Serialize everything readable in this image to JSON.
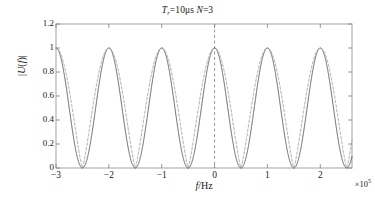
{
  "chart_data": {
    "type": "line",
    "title_parts": {
      "sym1": "T",
      "sub1": "r",
      "eq1": "=10μs ",
      "sym2": "N",
      "eq2": "=3"
    },
    "xlabel": "f/Hz",
    "xlabel_parts": {
      "italic": "f",
      "rest": "/Hz"
    },
    "ylabel": "|U(f)|",
    "ylabel_parts": {
      "pre": "|",
      "sym": "U",
      "open": "(",
      "var": "f",
      "close": ")",
      "post": "|"
    },
    "x_exponent_prefix": "×10",
    "x_exponent": "5",
    "xlim": [
      -3,
      2.6
    ],
    "ylim": [
      0,
      1.2
    ],
    "xticks": [
      -3,
      -2,
      -1,
      0,
      1,
      2
    ],
    "xticklabels": [
      "−3",
      "−2",
      "−1",
      "0",
      "1",
      "2"
    ],
    "yticks": [
      0,
      0.2,
      0.4,
      0.6,
      0.8,
      1,
      1.2
    ],
    "yticklabels": [
      "0",
      "0.2",
      "0.4",
      "0.6",
      "0.8",
      "1",
      "1.2"
    ],
    "grid": false,
    "legend": null,
    "x_unit_scale": 100000,
    "annotations": [
      {
        "name": "center-marker",
        "type": "vline",
        "x": 0,
        "style": "dashed",
        "color": "#808080"
      }
    ],
    "series": [
      {
        "name": "solid-curve",
        "style": "solid",
        "color": "#4d4d4d",
        "description": "|sin(pi f Tr)/ (pi f Tr)| style raised-cosine lobes, period 1e5 Hz",
        "peaks_x": [
          -2.5,
          -1.5,
          -0.5,
          0.5,
          1.5,
          2.5
        ],
        "peaks_y": [
          1,
          1,
          1,
          1,
          1,
          1
        ],
        "nulls_x": [
          -3,
          -2,
          -1,
          0,
          1,
          2
        ],
        "shape": "cos2",
        "exponent": 1.0,
        "period": 1.0,
        "phase": 0.5
      },
      {
        "name": "dashed-curve",
        "style": "dashed",
        "color": "#999999",
        "description": "narrower-null companion curve, same peak locations and unit amplitude",
        "peaks_x": [
          -2.5,
          -1.5,
          -0.5,
          0.5,
          1.5,
          2.5
        ],
        "peaks_y": [
          1,
          1,
          1,
          1,
          1,
          1
        ],
        "nulls_x": [
          -3,
          -2,
          -1,
          0,
          1,
          2
        ],
        "shape": "cos2",
        "exponent": 0.62,
        "period": 1.0,
        "phase": 0.5
      }
    ]
  },
  "axes": {
    "box_color": "#999999",
    "tick_color": "#808080"
  }
}
